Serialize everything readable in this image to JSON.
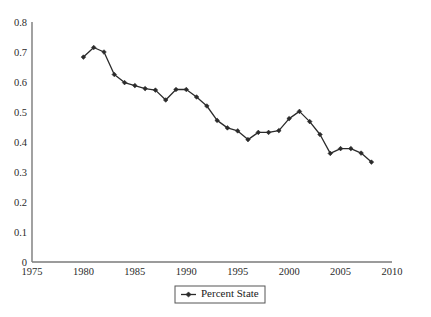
{
  "chart_data": {
    "type": "line",
    "title": "",
    "subtitle": "",
    "xlabel": "",
    "ylabel": "",
    "xlim": [
      1975,
      2010
    ],
    "ylim": [
      0,
      0.8
    ],
    "xticks": [
      1975,
      1980,
      1985,
      1990,
      1995,
      2000,
      2005,
      2010
    ],
    "xtick_labels": [
      "1975",
      "1980",
      "1985",
      "1990",
      "1995",
      "2000",
      "2005",
      "2010"
    ],
    "yticks": [
      0,
      0.1,
      0.2,
      0.3,
      0.4,
      0.5,
      0.6,
      0.7,
      0.8
    ],
    "ytick_labels": [
      "0",
      "0.1",
      "0.2",
      "0.3",
      "0.4",
      "0.5",
      "0.6",
      "0.7",
      "0.8"
    ],
    "grid": false,
    "legend_position": "bottom-center",
    "series": [
      {
        "name": "Percent State",
        "color": "#2b2b2b",
        "marker": "diamond",
        "x": [
          1980,
          1981,
          1982,
          1983,
          1984,
          1985,
          1986,
          1987,
          1988,
          1989,
          1990,
          1991,
          1992,
          1993,
          1994,
          1995,
          1996,
          1997,
          1998,
          1999,
          2000,
          2001,
          2002,
          2003,
          2004,
          2005,
          2006,
          2007,
          2008
        ],
        "values": [
          0.683,
          0.715,
          0.7,
          0.625,
          0.598,
          0.588,
          0.578,
          0.573,
          0.54,
          0.575,
          0.575,
          0.55,
          0.52,
          0.472,
          0.447,
          0.437,
          0.408,
          0.432,
          0.432,
          0.438,
          0.478,
          0.502,
          0.468,
          0.425,
          0.362,
          0.378,
          0.378,
          0.363,
          0.333
        ]
      }
    ],
    "legend": [
      {
        "label": "Percent State",
        "color": "#2b2b2b",
        "marker": "diamond"
      }
    ]
  },
  "axis": {
    "y_top_label": "0.8",
    "x_left_label": "1975",
    "x_right_label": "2010"
  }
}
